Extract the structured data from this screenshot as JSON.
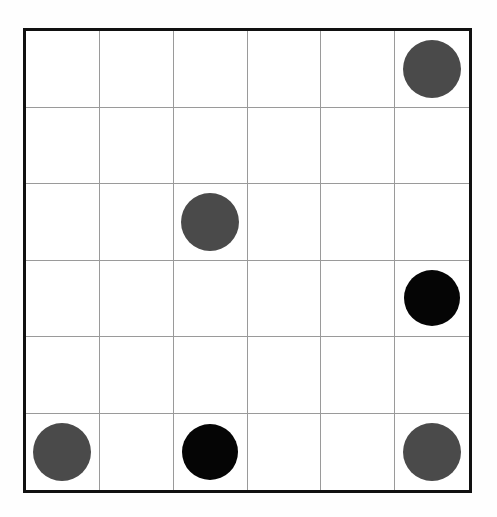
{
  "board": {
    "title": "Six by six grid with colored discs",
    "rows": 6,
    "cols": 6,
    "background_color": "#fefefe",
    "cell_color": "#ffffff",
    "outer_border_color": "#111111",
    "outer_border_width": 3,
    "grid_line_color": "#9a9a9a",
    "grid_line_width": 1,
    "frame": {
      "left": 23,
      "top": 28,
      "width": 449,
      "height": 465
    },
    "colors": {
      "gray_disc": "#4a4a4a",
      "black_disc": "#050505"
    },
    "disc_sizes": {
      "gray_diameter": 58,
      "black_diameter": 56
    },
    "counts": {
      "gray_discs": 4,
      "black_discs": 2,
      "empty_cells": 30,
      "total_cells": 36
    },
    "cells": [
      [
        null,
        null,
        null,
        null,
        null,
        "gray"
      ],
      [
        null,
        null,
        null,
        null,
        null,
        null
      ],
      [
        null,
        null,
        "gray",
        null,
        null,
        null
      ],
      [
        null,
        null,
        null,
        null,
        null,
        "black"
      ],
      [
        null,
        null,
        null,
        null,
        null,
        null
      ],
      [
        "gray",
        null,
        "black",
        null,
        null,
        "gray"
      ]
    ],
    "discs": [
      {
        "row": 1,
        "col": 6,
        "color": "gray"
      },
      {
        "row": 3,
        "col": 3,
        "color": "gray"
      },
      {
        "row": 4,
        "col": 6,
        "color": "black"
      },
      {
        "row": 6,
        "col": 1,
        "color": "gray"
      },
      {
        "row": 6,
        "col": 3,
        "color": "black"
      },
      {
        "row": 6,
        "col": 6,
        "color": "gray"
      }
    ]
  }
}
